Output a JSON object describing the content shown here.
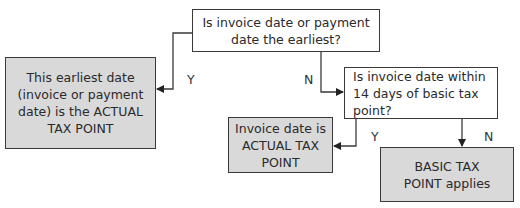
{
  "diagram": {
    "type": "flowchart",
    "colors": {
      "decision_fill": "#ffffff",
      "outcome_fill": "#d9d9d9",
      "line": "#3a3a3a"
    },
    "nodes": {
      "q1": {
        "text": "Is invoice date or payment date the earliest?"
      },
      "outcome_a": {
        "text": "This earliest date (invoice or payment date) is the ACTUAL TAX POINT"
      },
      "q2": {
        "text": "Is invoice date within 14 days of basic tax point?"
      },
      "outcome_b": {
        "text": "Invoice date is ACTUAL TAX POINT"
      },
      "outcome_c": {
        "text": "BASIC TAX POINT applies"
      }
    },
    "edges": [
      {
        "from": "q1",
        "to": "outcome_a",
        "label": "Y"
      },
      {
        "from": "q1",
        "to": "q2",
        "label": "N"
      },
      {
        "from": "q2",
        "to": "outcome_b",
        "label": "Y"
      },
      {
        "from": "q2",
        "to": "outcome_c",
        "label": "N"
      }
    ]
  }
}
